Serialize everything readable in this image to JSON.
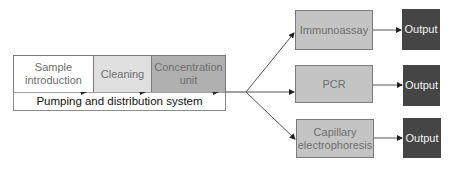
{
  "pipeline": {
    "stages": [
      {
        "label": "Sample introduction",
        "fill": "#ffffff"
      },
      {
        "label": "Cleaning",
        "fill": "#e0e0e0"
      },
      {
        "label": "Concentration unit",
        "fill": "#b0b0b0"
      }
    ],
    "base": {
      "label": "Pumping and distribution system"
    }
  },
  "methods": [
    {
      "label": "Immunoassay",
      "fill": "#c4c4c4"
    },
    {
      "label": "PCR",
      "fill": "#c4c4c4"
    },
    {
      "label": "Capillary electrophoresis",
      "fill": "#c4c4c4"
    }
  ],
  "outputs": [
    {
      "label": "Output",
      "fill": "#454545"
    },
    {
      "label": "Output",
      "fill": "#454545"
    },
    {
      "label": "Output",
      "fill": "#454545"
    }
  ]
}
